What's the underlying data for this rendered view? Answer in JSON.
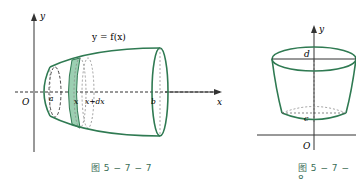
{
  "figures": [
    {
      "id": "fig-5-7-7",
      "caption": "图 5 − 7 − 7",
      "labels": {
        "y_axis": "y",
        "x_axis": "x",
        "origin": "O",
        "function": "y = f(x)",
        "a": "a",
        "x": "x",
        "x_plus_dx": "x+dx",
        "b": "b"
      }
    },
    {
      "id": "fig-5-7-8",
      "caption": "图 5 − 7 − 8",
      "labels": {
        "y_axis": "y",
        "d": "d",
        "c": "c",
        "origin": "O"
      }
    }
  ],
  "colors": {
    "curve": "#2f7a52",
    "fill": "#9ccfb2",
    "axis": "#333333",
    "dashed": "#777777",
    "caption": "#3a6e57"
  }
}
